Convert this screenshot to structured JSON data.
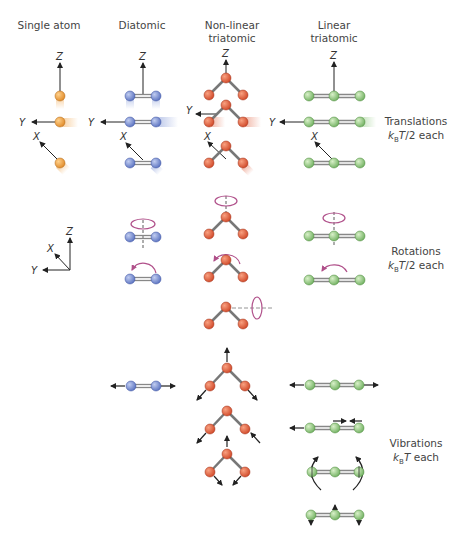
{
  "columns": [
    {
      "id": "single",
      "label": "Single atom"
    },
    {
      "id": "diatomic",
      "label": "Diatomic"
    },
    {
      "id": "nonlinear",
      "label_line1": "Non-linear",
      "label_line2": "triatomic"
    },
    {
      "id": "linear",
      "label_line1": "Linear",
      "label_line2": "triatomic"
    }
  ],
  "rows": [
    {
      "id": "translations",
      "title": "Translations",
      "energy_k": "k",
      "energy_sub": "B",
      "energy_T": "T",
      "energy_rest": "/2 each"
    },
    {
      "id": "rotations",
      "title": "Rotations",
      "energy_k": "k",
      "energy_sub": "B",
      "energy_T": "T",
      "energy_rest": "/2 each"
    },
    {
      "id": "vibrations",
      "title": "Vibrations",
      "energy_k": "k",
      "energy_sub": "B",
      "energy_T": "T",
      "energy_rest": " each"
    }
  ],
  "axes": {
    "x": "X",
    "y": "Y",
    "z": "Z"
  },
  "colors": {
    "single_atom": "#f0a040",
    "diatomic": "#7f95d6",
    "nonlinear": "#e0603e",
    "linear": "#90c880",
    "rotation_arrow": "#b0508a",
    "arrow": "#222222",
    "bond": "#888888"
  }
}
